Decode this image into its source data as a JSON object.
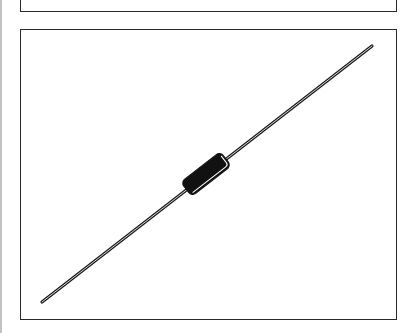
{
  "figure": {
    "panels": [
      {
        "name": "top-panel",
        "content": ""
      },
      {
        "name": "main-panel",
        "content": "axial component drawing"
      }
    ],
    "colors": {
      "ink": "#1a1a1a",
      "frame": "#2a2a2a",
      "background": "#ffffff",
      "body_highlight": "#ffffff"
    }
  }
}
